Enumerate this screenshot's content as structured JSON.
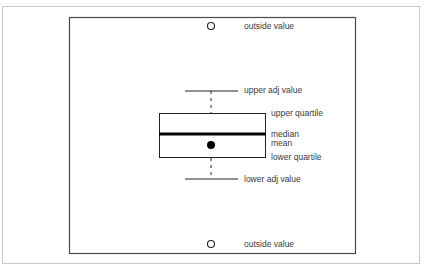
{
  "diagram": {
    "type": "boxplot-anatomy",
    "labels": {
      "outside_top": "outside value",
      "upper_adj": "upper adj value",
      "upper_quartile": "upper quartile",
      "median": "median",
      "mean": "mean",
      "lower_quartile": "lower quartile",
      "lower_adj": "lower adj value",
      "outside_bottom": "outside value"
    },
    "colors": {
      "frame": "#c8c8c8",
      "plot_border": "#4a4a4a",
      "stroke": "#222222",
      "text": "#3a3a3a"
    }
  }
}
